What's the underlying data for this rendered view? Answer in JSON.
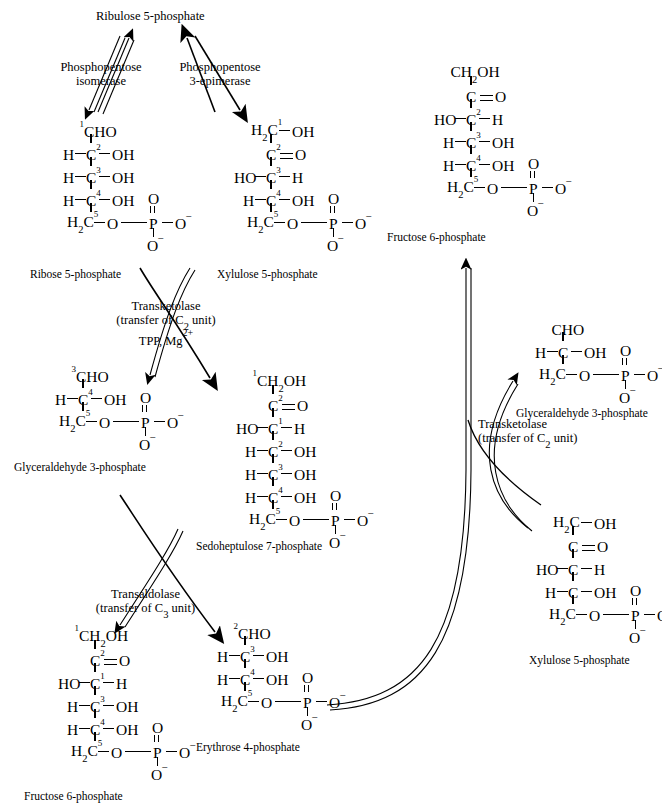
{
  "diagram": {
    "background": "#ffffff",
    "ink": "#000000"
  },
  "molecules": {
    "ribulose5p": {
      "name": "Ribulose 5-phosphate"
    },
    "ribose5p": {
      "name": "Ribose 5-phosphate",
      "rows": [
        {
          "num": "1",
          "text": "CHO"
        },
        {
          "num": "2",
          "left": "H",
          "right": "OH"
        },
        {
          "num": "3",
          "left": "H",
          "right": "OH"
        },
        {
          "num": "4",
          "left": "H",
          "right": "OH"
        },
        {
          "num": "5",
          "text": "H2C",
          "phosphate": true
        }
      ]
    },
    "xylulose5p_top": {
      "name": "Xylulose 5-phosphate",
      "rows": [
        {
          "num": "1",
          "text": "H2C",
          "right": "OH"
        },
        {
          "num": "2",
          "text": "C",
          "dbl": "O"
        },
        {
          "num": "3",
          "left": "HO",
          "right": "H"
        },
        {
          "num": "4",
          "left": "H",
          "right": "OH"
        },
        {
          "num": "5",
          "text": "H2C",
          "phosphate": true
        }
      ]
    },
    "glyceraldehyde3p_left": {
      "name": "Glyceraldehyde 3-phosphate",
      "rows": [
        {
          "num": "3",
          "text": "CHO"
        },
        {
          "num": "4",
          "left": "H",
          "right": "OH"
        },
        {
          "num": "5",
          "text": "H2C",
          "phosphate": true
        }
      ]
    },
    "sedoheptulose7p": {
      "name": "Sedoheptulose 7-phosphate",
      "rows": [
        {
          "num": "1",
          "text": "CH2OH"
        },
        {
          "num": "2",
          "text": "C",
          "dbl": "O"
        },
        {
          "num": "1",
          "left": "HO",
          "right": "H"
        },
        {
          "num": "2",
          "left": "H",
          "right": "OH"
        },
        {
          "num": "3",
          "left": "H",
          "right": "OH"
        },
        {
          "num": "4",
          "left": "H",
          "right": "OH"
        },
        {
          "num": "5",
          "text": "H2C",
          "phosphate": true
        }
      ]
    },
    "fructose6p_bottom": {
      "name": "Fructose 6-phosphate",
      "rows": [
        {
          "num": "1",
          "text": "CH2OH"
        },
        {
          "num": "2",
          "text": "C",
          "dbl": "O"
        },
        {
          "num": "1",
          "left": "HO",
          "right": "H"
        },
        {
          "num": "3",
          "left": "H",
          "right": "OH"
        },
        {
          "num": "4",
          "left": "H",
          "right": "OH"
        },
        {
          "num": "5",
          "text": "H2C",
          "phosphate": true
        }
      ]
    },
    "erythrose4p": {
      "name": "Erythrose 4-phosphate",
      "rows": [
        {
          "num": "2",
          "text": "CHO"
        },
        {
          "num": "3",
          "left": "H",
          "right": "OH"
        },
        {
          "num": "4",
          "left": "H",
          "right": "OH"
        },
        {
          "num": "5",
          "text": "H2C",
          "phosphate": true
        }
      ]
    },
    "fructose6p_top": {
      "name": "Fructose 6-phosphate",
      "rows": [
        {
          "num": "",
          "text": "CH2OH"
        },
        {
          "num": "",
          "text": "C",
          "dbl": "O"
        },
        {
          "num": "2",
          "left": "HO",
          "right": "H"
        },
        {
          "num": "3",
          "left": "H",
          "right": "OH"
        },
        {
          "num": "4",
          "left": "H",
          "right": "OH"
        },
        {
          "num": "5",
          "text": "H2C",
          "phosphate": true
        }
      ]
    },
    "glyceraldehyde3p_right": {
      "name": "Glyceraldehyde 3-phosphate",
      "rows": [
        {
          "num": "",
          "text": "CHO"
        },
        {
          "num": "",
          "left": "H",
          "right": "OH"
        },
        {
          "num": "",
          "text": "H2C",
          "phosphate": true
        }
      ]
    },
    "xylulose5p_right": {
      "name": "Xylulose 5-phosphate",
      "rows": [
        {
          "num": "",
          "text": "H2C",
          "right": "OH"
        },
        {
          "num": "",
          "text": "C",
          "dbl": "O"
        },
        {
          "num": "",
          "left": "HO",
          "right": "H"
        },
        {
          "num": "",
          "left": "H",
          "right": "OH"
        },
        {
          "num": "",
          "text": "H2C",
          "phosphate": true
        }
      ]
    }
  },
  "enzymes": {
    "phosphopentose_isomerase": {
      "line1": "Phosphopentose",
      "line2": "isomerase"
    },
    "phosphopentose_3epimerase": {
      "line1": "Phosphopentose",
      "line2": "3-epimerase"
    },
    "transketolase_middle": {
      "line1": "Transketolase",
      "line2": "(transfer of C2 unit)",
      "line3": "TPP, Mg2+"
    },
    "transaldolase": {
      "line1": "Transaldolase",
      "line2": "(transfer of C3 unit)"
    },
    "transketolase_right": {
      "line1": "Transketolase",
      "line2": "(transfer of C2 unit)"
    }
  },
  "labels": {
    "phosphate_O_minus": "O–",
    "P": "P",
    "O": "O"
  }
}
